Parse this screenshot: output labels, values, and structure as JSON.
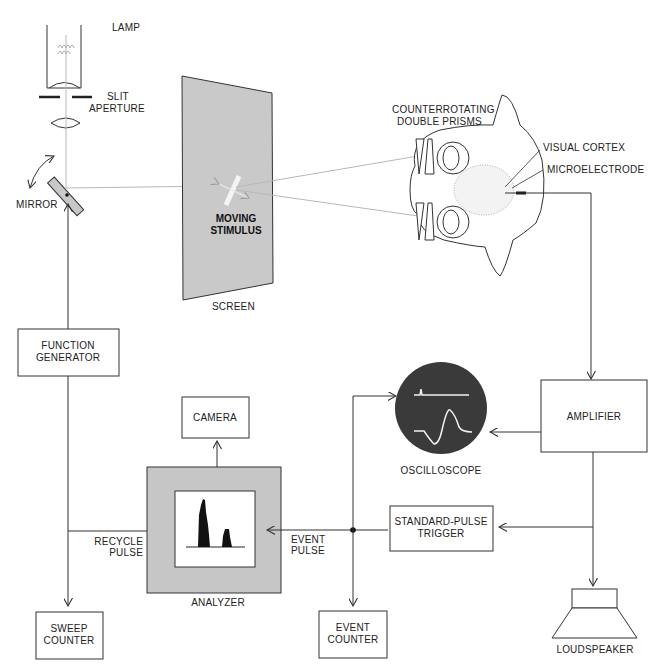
{
  "diagram": {
    "labels": {
      "lamp": "LAMP",
      "slit_aperture_1": "SLIT",
      "slit_aperture_2": "APERTURE",
      "mirror": "MIRROR",
      "moving_stimulus_1": "MOVING",
      "moving_stimulus_2": "STIMULUS",
      "screen": "SCREEN",
      "prisms_1": "COUNTERROTATING",
      "prisms_2": "DOUBLE PRISMS",
      "visual_cortex": "VISUAL CORTEX",
      "microelectrode": "MICROELECTRODE",
      "function_generator_1": "FUNCTION",
      "function_generator_2": "GENERATOR",
      "camera": "CAMERA",
      "oscilloscope": "OSCILLOSCOPE",
      "amplifier": "AMPLIFIER",
      "recycle_pulse_1": "RECYCLE",
      "recycle_pulse_2": "PULSE",
      "event_pulse_1": "EVENT",
      "event_pulse_2": "PULSE",
      "standard_pulse_trigger_1": "STANDARD-PULSE",
      "standard_pulse_trigger_2": "TRIGGER",
      "analyzer": "ANALYZER",
      "sweep_counter_1": "SWEEP",
      "sweep_counter_2": "COUNTER",
      "event_counter_1": "EVENT",
      "event_counter_2": "COUNTER",
      "loudspeaker": "LOUDSPEAKER"
    },
    "colors": {
      "line": "#333333",
      "beam": "#b8b8b8",
      "screen_fill": "#c9c9c9",
      "analyzer_fill": "#c6c6c6",
      "oscilloscope_fill": "#3a3a3a",
      "trace": "#f2f2f2"
    }
  }
}
